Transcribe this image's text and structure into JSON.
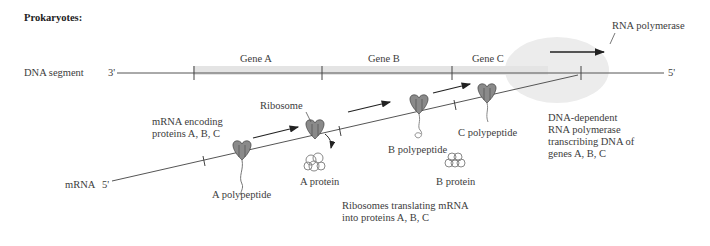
{
  "title": "Prokaryotes:",
  "dna": {
    "label": "DNA segment",
    "end_left": "3'",
    "end_right": "5'",
    "genes": [
      {
        "label": "Gene A"
      },
      {
        "label": "Gene B"
      },
      {
        "label": "Gene C"
      }
    ]
  },
  "polymerase": {
    "label": "RNA polymerase",
    "description": "DNA-dependent\nRNA polymerase\ntranscribing DNA of\ngenes A, B, C"
  },
  "mrna": {
    "label": "mRNA",
    "end": "5'",
    "encoding_label": "mRNA encoding\nproteins A, B, C"
  },
  "ribosome_label": "Ribosome",
  "polypeptides": {
    "a": "A polypeptide",
    "b": "B polypeptide",
    "c": "C polypeptide"
  },
  "proteins": {
    "a": "A protein",
    "b": "B protein"
  },
  "translation_caption": "Ribosomes translating mRNA\ninto proteins A, B, C",
  "colors": {
    "gene_band": "#e6e6e6",
    "polymerase_ellipse": "#ececec",
    "ribosome": "#8a8a8a",
    "line": "#555555"
  }
}
